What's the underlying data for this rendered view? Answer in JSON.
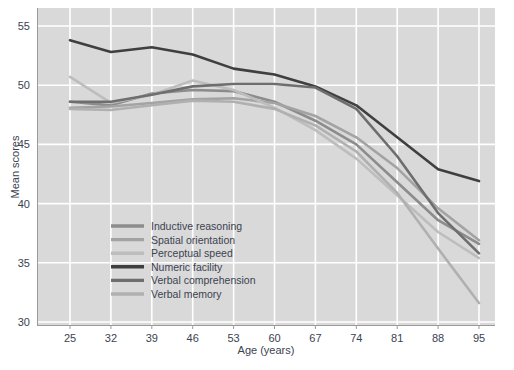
{
  "chart_data": {
    "type": "line",
    "title": "",
    "xlabel": "Age (years)",
    "ylabel": "Mean scores",
    "x": [
      25,
      32,
      39,
      46,
      53,
      60,
      67,
      74,
      81,
      88,
      95
    ],
    "xtick_labels": [
      "25",
      "32",
      "39",
      "46",
      "53",
      "60",
      "67",
      "74",
      "81",
      "88",
      "95"
    ],
    "ytick_labels": [
      "30",
      "35",
      "40",
      "45",
      "50",
      "55"
    ],
    "yticks": [
      30,
      35,
      40,
      45,
      50,
      55
    ],
    "xlim": [
      25,
      95
    ],
    "ylim": [
      30,
      55
    ],
    "grid": true,
    "legend_position": "inside-lower-left",
    "series": [
      {
        "name": "Inductive reasoning",
        "color": "#8c8c8c",
        "values": [
          48.6,
          48.3,
          49.3,
          49.6,
          49.5,
          48.6,
          47.0,
          45.0,
          41.8,
          38.6,
          36.6
        ]
      },
      {
        "name": "Spatial orientation",
        "color": "#a3a3a3",
        "values": [
          48.1,
          48.2,
          48.5,
          48.8,
          48.9,
          48.5,
          47.4,
          45.6,
          43.0,
          39.6,
          36.9
        ]
      },
      {
        "name": "Perceptual speed",
        "color": "#bdbdbd",
        "values": [
          50.7,
          48.5,
          49.2,
          50.4,
          49.6,
          48.1,
          46.2,
          43.8,
          40.7,
          37.6,
          35.4
        ]
      },
      {
        "name": "Numeric facility",
        "color": "#3f3f3f",
        "values": [
          53.8,
          52.8,
          53.2,
          52.6,
          51.4,
          50.9,
          49.9,
          48.3,
          45.6,
          42.9,
          41.9
        ]
      },
      {
        "name": "Verbal comprehension",
        "color": "#6e6e6e",
        "values": [
          48.6,
          48.6,
          49.2,
          49.9,
          50.1,
          50.1,
          49.8,
          48.0,
          44.0,
          39.2,
          35.8
        ]
      },
      {
        "name": "Verbal memory",
        "color": "#b0b0b0",
        "values": [
          48.0,
          47.9,
          48.3,
          48.7,
          48.6,
          48.0,
          46.6,
          44.4,
          40.9,
          36.2,
          31.6
        ]
      }
    ]
  },
  "legend": {
    "entries": [
      "Inductive reasoning",
      "Spatial orientation",
      "Perceptual speed",
      "Numeric facility",
      "Verbal comprehension",
      "Verbal memory"
    ]
  },
  "colors": {
    "plot_background": "#d9d9d9",
    "page_background": "#ffffff",
    "gridline": "#ffffff",
    "axis_text": "#3b4351"
  }
}
